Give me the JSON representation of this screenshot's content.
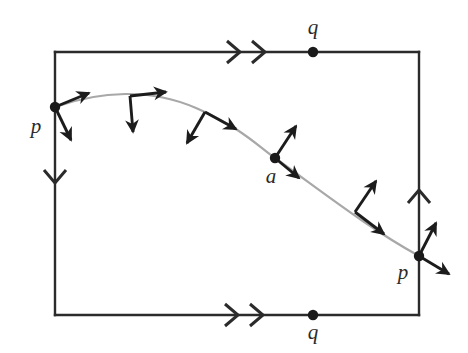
{
  "figure": {
    "type": "geometry-diagram",
    "canvas": {
      "width": 468,
      "height": 353,
      "background": "#ffffff"
    },
    "colors": {
      "frame": "#2b2b2b",
      "curve": "#a8a8a8",
      "vector": "#1c1c1c",
      "point": "#1a1a1a",
      "label": "#2b2b2b"
    },
    "square": {
      "left": 55,
      "top": 52,
      "right": 419,
      "bottom": 315,
      "stroke_width": 2.4
    },
    "edge_identifications": [
      {
        "name": "top-edge",
        "marker": "double-arrow",
        "direction": "right",
        "label": "q"
      },
      {
        "name": "bottom-edge",
        "marker": "double-arrow",
        "direction": "right",
        "label": "q"
      },
      {
        "name": "left-edge",
        "marker": "single-arrow",
        "direction": "down",
        "label": "p"
      },
      {
        "name": "right-edge",
        "marker": "single-arrow",
        "direction": "up",
        "label": "p"
      }
    ],
    "points": [
      {
        "name": "point-p-left",
        "label": "p",
        "x": 55,
        "y": 107,
        "label_x": 36,
        "label_y": 128
      },
      {
        "name": "point-p-right",
        "label": "p",
        "x": 419,
        "y": 256,
        "label_x": 403,
        "label_y": 274
      },
      {
        "name": "point-q-top",
        "label": "q",
        "x": 313,
        "y": 52,
        "label_x": 313,
        "label_y": 29
      },
      {
        "name": "point-q-bottom",
        "label": "q",
        "x": 313,
        "y": 315,
        "label_x": 313,
        "label_y": 334
      },
      {
        "name": "point-a",
        "label": "a",
        "x": 275,
        "y": 158,
        "label_x": 271,
        "label_y": 178
      }
    ],
    "curve": {
      "name": "geodesic-curve",
      "description": "gray arc from p on the left edge rising over an apex then descending to p on the right edge",
      "path": "M 55 107 C 100 91, 150 88, 196 108 C 240 127, 258 146, 275 158 C 320 190, 368 228, 419 256",
      "stroke": "#a8a8a8",
      "stroke_width": 2.2
    },
    "frames": [
      {
        "name": "frame-at-p-left",
        "origin_x": 55,
        "origin_y": 107,
        "tangent_dx": 34,
        "tangent_dy": -14,
        "normal_dx": 16,
        "normal_dy": 33
      },
      {
        "name": "frame-apex",
        "origin_x": 130,
        "origin_y": 96,
        "tangent_dx": 36,
        "tangent_dy": -4,
        "normal_dx": 3,
        "normal_dy": 36
      },
      {
        "name": "frame-descending",
        "origin_x": 205,
        "origin_y": 112,
        "tangent_dx": 31,
        "tangent_dy": 17,
        "normal_dx": -18,
        "normal_dy": 31
      },
      {
        "name": "frame-at-a",
        "origin_x": 275,
        "origin_y": 158,
        "tangent_dx": 24,
        "tangent_dy": 20,
        "normal_dx": 21,
        "normal_dy": -32
      },
      {
        "name": "frame-lower",
        "origin_x": 355,
        "origin_y": 212,
        "tangent_dx": 29,
        "tangent_dy": 22,
        "normal_dx": 21,
        "normal_dy": -31
      },
      {
        "name": "frame-at-p-right",
        "origin_x": 419,
        "origin_y": 256,
        "tangent_dx": 30,
        "tangent_dy": 18,
        "normal_dx": 17,
        "normal_dy": -33
      }
    ],
    "edge_markers": {
      "top": {
        "x": 240,
        "y": 52,
        "chevrons": 2,
        "direction": "right"
      },
      "bottom": {
        "x": 238,
        "y": 315,
        "chevrons": 2,
        "direction": "right"
      },
      "left": {
        "x": 55,
        "y": 183,
        "chevrons": 1,
        "direction": "down"
      },
      "right": {
        "x": 419,
        "y": 190,
        "chevrons": 1,
        "direction": "up"
      }
    }
  }
}
